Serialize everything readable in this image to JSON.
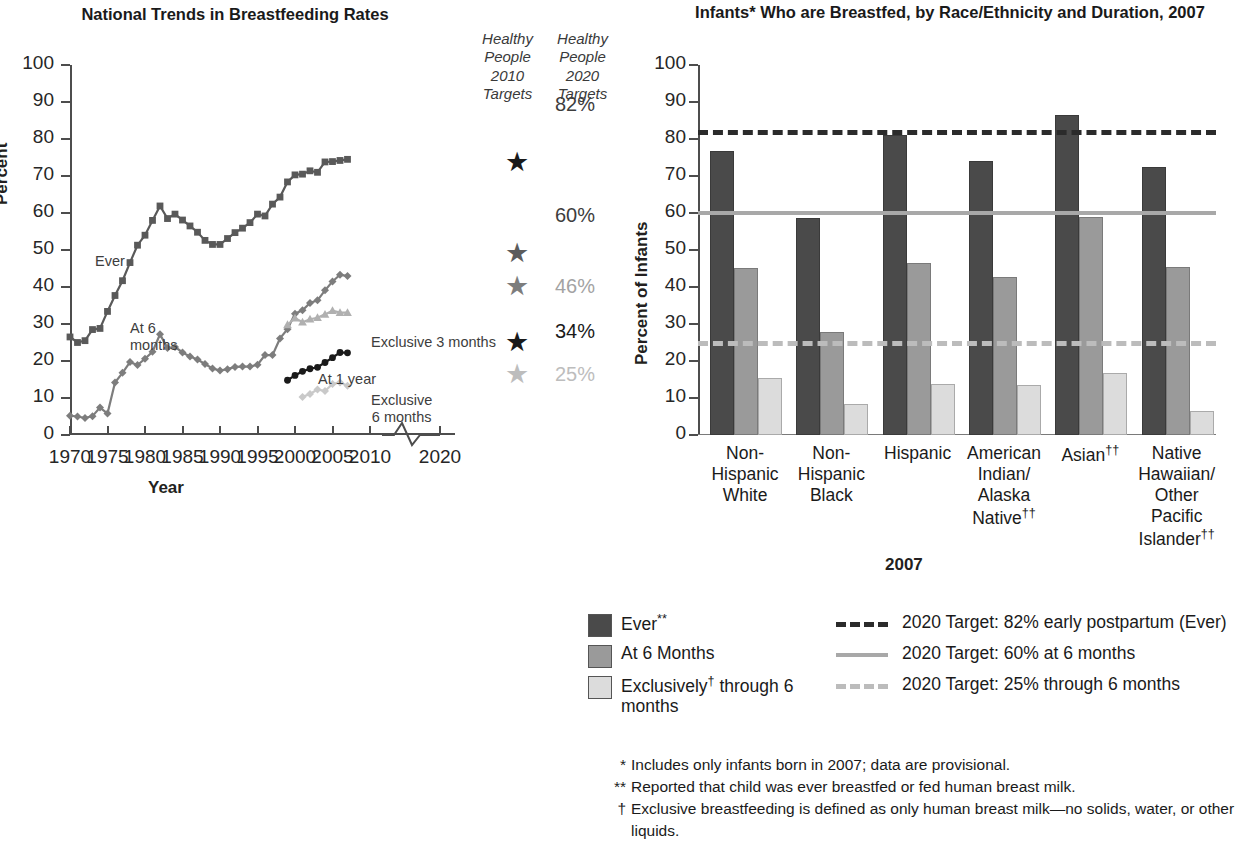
{
  "left": {
    "title": "National Trends in Breastfeeding Rates",
    "ylabel": "Percent",
    "xlabel": "Year",
    "hp2010_head": [
      "Healthy",
      "People",
      "2010",
      "Targets"
    ],
    "hp2020_head": [
      "Healthy",
      "People",
      "2020",
      "Targets"
    ],
    "series_notes": {
      "ever": "Ever",
      "at6": "At 6\nmonths",
      "at1yr": "At 1 year",
      "excl3": "Exclusive 3 months",
      "excl6": "Exclusive\n6 months"
    },
    "targets_2020": [
      "82%",
      "60%",
      "46%",
      "34%",
      "25%"
    ],
    "star_values": [
      75,
      50,
      40,
      25,
      16.5
    ]
  },
  "right": {
    "title": "Infants* Who are Breastfed, by Race/Ethnicity and Duration, 2007",
    "ylabel": "Percent of Infants",
    "xlabel": "2007"
  },
  "legend": {
    "swatches": [
      {
        "label": "Ever**",
        "color": "#4a4a4a"
      },
      {
        "label": "At 6 Months",
        "color": "#9a9a9a"
      },
      {
        "label": "Exclusively† through 6 months",
        "color": "#dcdcdc"
      }
    ],
    "lines": [
      {
        "label": "2020 Target: 82% early postpartum (Ever)",
        "color": "#2b2b2b",
        "style": "dashed"
      },
      {
        "label": "2020 Target: 60% at 6 months",
        "color": "#a8a8a8",
        "style": "solid"
      },
      {
        "label": "2020 Target: 25% through 6 months",
        "color": "#bcbcbc",
        "style": "dashed"
      }
    ]
  },
  "footnotes": [
    {
      "mark": "*",
      "text": "Includes only infants born in 2007; data are provisional."
    },
    {
      "mark": "**",
      "text": "Reported that child was ever breastfed or fed human breast milk."
    },
    {
      "mark": "†",
      "text": "Exclusive breastfeeding is defined as only human breast milk—no solids, water, or other liquids."
    }
  ],
  "chart_data": [
    {
      "type": "line",
      "title": "National Trends in Breastfeeding Rates",
      "xlabel": "Year",
      "ylabel": "Percent",
      "xlim": [
        1970,
        2010
      ],
      "ylim": [
        0,
        100
      ],
      "xticks": [
        1970,
        1975,
        1980,
        1985,
        1990,
        1995,
        2000,
        2005,
        2010,
        2020
      ],
      "yticks": [
        0,
        10,
        20,
        30,
        40,
        50,
        60,
        70,
        80,
        90,
        100
      ],
      "axis_break": "between 2010 and 2020",
      "grid": false,
      "series": [
        {
          "name": "Ever",
          "color": "#595959",
          "marker": "square",
          "x": [
            1970,
            1971,
            1972,
            1973,
            1974,
            1975,
            1976,
            1977,
            1978,
            1979,
            1980,
            1981,
            1982,
            1983,
            1984,
            1985,
            1986,
            1987,
            1988,
            1989,
            1990,
            1991,
            1992,
            1993,
            1994,
            1995,
            1996,
            1997,
            1998,
            1999,
            2000,
            2001,
            2002,
            2003,
            2004,
            2005,
            2006,
            2007
          ],
          "values": [
            26.5,
            25.0,
            25.5,
            28.5,
            28.8,
            33.4,
            37.7,
            41.7,
            46.6,
            51.3,
            54.0,
            58.0,
            61.9,
            58.5,
            59.7,
            58.1,
            56.5,
            54.8,
            52.6,
            51.5,
            51.5,
            53.1,
            54.7,
            55.9,
            57.4,
            59.7,
            59.2,
            62.4,
            64.3,
            68.4,
            70.3,
            70.5,
            71.4,
            71.0,
            73.8,
            73.9,
            74.2,
            74.5
          ]
        },
        {
          "name": "At 6 months",
          "color": "#7d7d7d",
          "marker": "diamond",
          "x": [
            1970,
            1971,
            1972,
            1973,
            1974,
            1975,
            1976,
            1977,
            1978,
            1979,
            1980,
            1981,
            1982,
            1983,
            1984,
            1985,
            1986,
            1987,
            1988,
            1989,
            1990,
            1991,
            1992,
            1993,
            1994,
            1995,
            1996,
            1997,
            1998,
            1999,
            2000,
            2001,
            2002,
            2003,
            2004,
            2005,
            2006,
            2007
          ],
          "values": [
            5.2,
            5.0,
            4.6,
            5.1,
            7.4,
            5.8,
            14.2,
            16.8,
            19.7,
            18.9,
            20.6,
            22.5,
            27.2,
            23.5,
            23.8,
            22.3,
            21.2,
            20.4,
            19.2,
            18.0,
            17.4,
            17.8,
            18.4,
            18.5,
            18.5,
            19.0,
            21.6,
            21.6,
            26.1,
            28.6,
            32.8,
            33.7,
            35.7,
            36.4,
            39.1,
            41.5,
            43.3,
            43.0
          ]
        },
        {
          "name": "Exclusive 3 months",
          "color": "#b0b0b0",
          "marker": "triangle",
          "x": [
            1999,
            2000,
            2001,
            2002,
            2003,
            2004,
            2005,
            2006,
            2007
          ],
          "values": [
            29.8,
            31.6,
            30.5,
            31.3,
            31.7,
            32.6,
            33.6,
            33.1,
            33.1
          ]
        },
        {
          "name": "At 1 year",
          "color": "#1a1a1a",
          "marker": "circle",
          "x": [
            1999,
            2000,
            2001,
            2002,
            2003,
            2004,
            2005,
            2006,
            2007
          ],
          "values": [
            14.8,
            16.1,
            17.2,
            17.9,
            18.3,
            19.6,
            20.9,
            22.3,
            22.2
          ]
        },
        {
          "name": "Exclusive 6 months",
          "color": "#c9c9c9",
          "marker": "diamond",
          "x": [
            2001,
            2002,
            2003,
            2004,
            2005,
            2006,
            2007
          ],
          "values": [
            10.3,
            11.1,
            12.3,
            11.9,
            13.8,
            14.2,
            13.3
          ]
        }
      ],
      "annotations": [
        {
          "text": "Healthy People 2010 Targets",
          "type": "column-header"
        },
        {
          "text": "Healthy People 2020 Targets",
          "type": "column-header"
        },
        {
          "text": "82%",
          "target_year": 2020,
          "value": 82
        },
        {
          "text": "60%",
          "target_year": 2020,
          "value": 60
        },
        {
          "text": "46%",
          "target_year": 2020,
          "value": 46
        },
        {
          "text": "34%",
          "target_year": 2020,
          "value": 34
        },
        {
          "text": "25%",
          "target_year": 2020,
          "value": 25
        }
      ],
      "hp2010_stars": [
        {
          "at": 2010,
          "value": 75,
          "color": "#1a1a1a"
        },
        {
          "at": 2010,
          "value": 50,
          "color": "#595959"
        },
        {
          "at": 2010,
          "value": 40,
          "color": "#7d7d7d"
        },
        {
          "at": 2010,
          "value": 25,
          "color": "#1a1a1a"
        },
        {
          "at": 2010,
          "value": 16.5,
          "color": "#b0b0b0"
        }
      ]
    },
    {
      "type": "bar",
      "title": "Infants* Who are Breastfed, by Race/Ethnicity and Duration, 2007",
      "xlabel": "2007",
      "ylabel": "Percent of Infants",
      "ylim": [
        0,
        100
      ],
      "yticks": [
        0,
        10,
        20,
        30,
        40,
        50,
        60,
        70,
        80,
        90,
        100
      ],
      "grid": false,
      "legend_position": "below",
      "categories": [
        "Non-Hispanic White",
        "Non-Hispanic Black",
        "Hispanic",
        "American Indian/ Alaska Native††",
        "Asian††",
        "Native Hawaiian/ Other Pacific Islander††"
      ],
      "category_lines": [
        [
          "Non-",
          "Hispanic",
          "White"
        ],
        [
          "Non-",
          "Hispanic",
          "Black"
        ],
        [
          "Hispanic"
        ],
        [
          "American",
          "Indian/",
          "Alaska",
          "Native††"
        ],
        [
          "Asian††"
        ],
        [
          "Native",
          "Hawaiian/",
          "Other",
          "Pacific",
          "Islander††"
        ]
      ],
      "series": [
        {
          "name": "Ever**",
          "color": "#4a4a4a",
          "values": [
            76.2,
            58.1,
            80.6,
            73.6,
            86.0,
            72.0
          ]
        },
        {
          "name": "At 6 Months",
          "color": "#9a9a9a",
          "values": [
            44.7,
            27.3,
            45.9,
            42.1,
            58.4,
            44.8
          ]
        },
        {
          "name": "Exclusively† through 6 months",
          "color": "#dcdcdc",
          "values": [
            14.8,
            7.9,
            13.3,
            12.9,
            16.3,
            6.0
          ]
        }
      ],
      "reference_lines": [
        {
          "label": "2020 Target: 82% early postpartum (Ever)",
          "value": 82,
          "color": "#2b2b2b",
          "style": "dashed"
        },
        {
          "label": "2020 Target: 60% at 6 months",
          "value": 60,
          "color": "#a8a8a8",
          "style": "solid"
        },
        {
          "label": "2020 Target: 25% through 6 months",
          "value": 25,
          "color": "#bcbcbc",
          "style": "dashed"
        }
      ]
    }
  ]
}
